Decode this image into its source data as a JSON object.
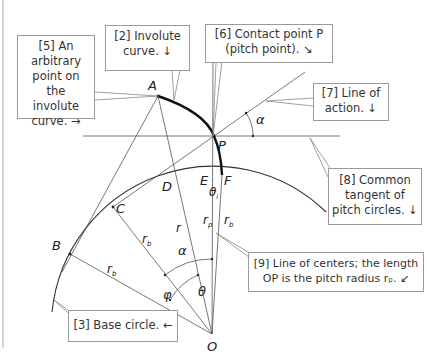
{
  "callouts": {
    "c5": {
      "line1": "[5] An",
      "line2": "arbitrary",
      "line3": "point on the",
      "line4": "involute",
      "line5": "curve. →"
    },
    "c2": {
      "line1": "[2] Involute",
      "line2": "curve. ↓"
    },
    "c6": {
      "line1": "[6] Contact point P",
      "line2": "(pitch point). ↘"
    },
    "c7": {
      "line1": "[7] Line of",
      "line2": "action. ↓"
    },
    "c8": {
      "line1": "[8] Common",
      "line2": "tangent of",
      "line3": "pitch circles. ↓"
    },
    "c9": {
      "line1": "[9] Line of centers; the length",
      "line2": "OP is the pitch radius rₚ. ↙"
    },
    "c3": {
      "line1": "[3] Base circle. ←"
    }
  },
  "points": {
    "A": "A",
    "P": "P",
    "B": "B",
    "C": "C",
    "D": "D",
    "E": "E",
    "F": "F",
    "O": "O"
  },
  "symbols": {
    "alpha_top": "α",
    "alpha_mid": "α",
    "phi": "φ",
    "theta": "θ",
    "theta_small": "θ",
    "theta_sub": "i",
    "r": "r",
    "r_p": "r",
    "r_p_sub": "p",
    "r_b_F": "r",
    "r_b_F_sub": "b",
    "r_b_C": "r",
    "r_b_C_sub": "b",
    "r_b_B": "r",
    "r_b_B_sub": "b"
  }
}
